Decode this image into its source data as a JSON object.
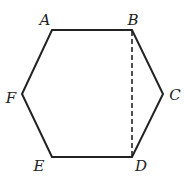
{
  "diagram": {
    "shape": "hexagon",
    "vertices": [
      {
        "label": "A",
        "x": 52,
        "y": 30,
        "lx": 45,
        "ly": 20
      },
      {
        "label": "B",
        "x": 132,
        "y": 30,
        "lx": 133,
        "ly": 20
      },
      {
        "label": "C",
        "x": 163,
        "y": 94,
        "lx": 175,
        "ly": 95
      },
      {
        "label": "D",
        "x": 132,
        "y": 157,
        "lx": 141,
        "ly": 166
      },
      {
        "label": "E",
        "x": 52,
        "y": 157,
        "lx": 39,
        "ly": 166
      },
      {
        "label": "F",
        "x": 22,
        "y": 94,
        "lx": 11,
        "ly": 98
      }
    ],
    "solid_edges": [
      "AB",
      "BC",
      "CD",
      "DE",
      "EF",
      "FA"
    ],
    "dashed_segments": [
      "BD"
    ],
    "stroke_color": "#222222"
  }
}
